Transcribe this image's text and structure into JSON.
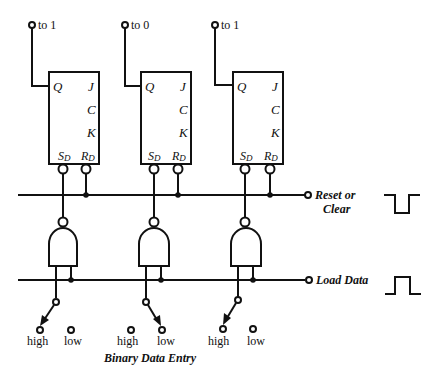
{
  "diagram": {
    "type": "circuit",
    "flip_flops": [
      {
        "id": "ff1",
        "output_label": "to 1",
        "pins": {
          "q": "Q",
          "j": "J",
          "c": "C",
          "k": "K",
          "sd": "S",
          "sd_sub": "D",
          "rd": "R",
          "rd_sub": "D"
        }
      },
      {
        "id": "ff2",
        "output_label": "to 0",
        "pins": {
          "q": "Q",
          "j": "J",
          "c": "C",
          "k": "K",
          "sd": "S",
          "sd_sub": "D",
          "rd": "R",
          "rd_sub": "D"
        }
      },
      {
        "id": "ff3",
        "output_label": "to 1",
        "pins": {
          "q": "Q",
          "j": "J",
          "c": "C",
          "k": "K",
          "sd": "S",
          "sd_sub": "D",
          "rd": "R",
          "rd_sub": "D"
        }
      }
    ],
    "lines": {
      "reset": {
        "label_line1": "Reset or",
        "label_line2": "Clear",
        "waveform": "negative-pulse"
      },
      "load": {
        "label": "Load Data",
        "waveform": "positive-pulse"
      }
    },
    "switches": [
      {
        "high": "high",
        "low": "low",
        "position": "high"
      },
      {
        "high": "high",
        "low": "low",
        "position": "low"
      },
      {
        "high": "high",
        "low": "low",
        "position": "high"
      }
    ],
    "caption": "Binary Data Entry"
  }
}
